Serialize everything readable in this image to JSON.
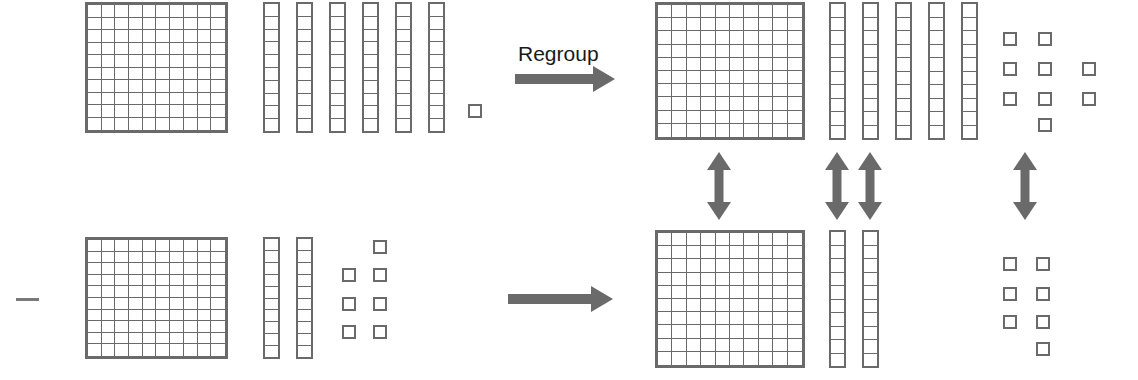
{
  "diagram": {
    "operation_sign": "−",
    "regroup_label": "Regroup",
    "colors": {
      "block_outline": "#6a6a6a",
      "block_fill": "#ffffff",
      "arrow": "#6a6a6a",
      "text": "#1a1a1a",
      "background": "#ffffff"
    },
    "rows": [
      {
        "id": "minuend",
        "role": "minuend",
        "before": {
          "hundreds": 1,
          "tens": 6,
          "ones": 1,
          "value": 161,
          "ones_layout": [
            [
              1
            ]
          ]
        },
        "after": {
          "hundreds": 1,
          "tens": 5,
          "ones": 11,
          "value": 161,
          "ones_layout": [
            [
              1,
              1,
              0
            ],
            [
              1,
              1,
              1
            ],
            [
              1,
              1,
              1
            ],
            [
              0,
              1,
              0
            ],
            [
              0,
              0,
              1
            ]
          ]
        },
        "arrow": {
          "type": "horizontal",
          "label": "Regroup"
        }
      },
      {
        "id": "subtrahend",
        "role": "subtrahend",
        "before": {
          "hundreds": 1,
          "tens": 2,
          "ones": 7,
          "value": 127,
          "ones_layout": [
            [
              0,
              1
            ],
            [
              1,
              1
            ],
            [
              1,
              1
            ],
            [
              1,
              1
            ]
          ]
        },
        "after": {
          "hundreds": 1,
          "tens": 2,
          "ones": 7,
          "value": 127,
          "ones_layout": [
            [
              1,
              1
            ],
            [
              1,
              1
            ],
            [
              1,
              1
            ],
            [
              0,
              1
            ]
          ]
        },
        "arrow": {
          "type": "horizontal",
          "label": ""
        }
      }
    ],
    "vertical_arrows": [
      {
        "column": "hundreds",
        "double_headed": true
      },
      {
        "column": "tens-1",
        "double_headed": true
      },
      {
        "column": "tens-2",
        "double_headed": true
      },
      {
        "column": "ones",
        "double_headed": true
      }
    ],
    "flat_grid": {
      "rows": 10,
      "cols": 10
    },
    "rod_segments": 10
  }
}
